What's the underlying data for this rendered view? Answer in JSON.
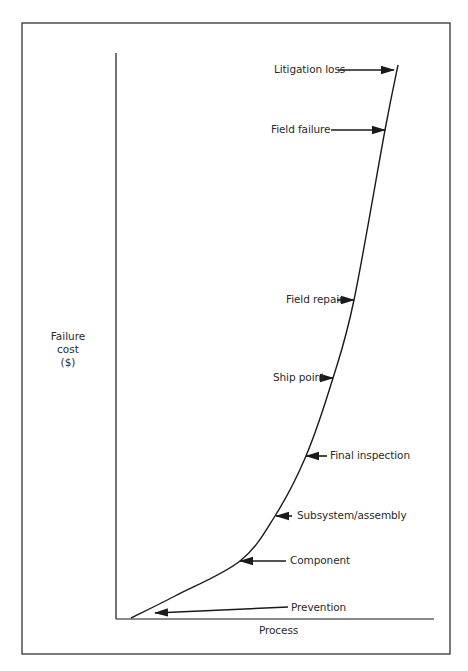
{
  "chart_data": {
    "type": "line",
    "title": "",
    "xlabel": "Process",
    "ylabel": "Failure cost ($)",
    "ylabel_lines": [
      "Failure",
      "cost",
      "($)"
    ],
    "grid": false,
    "legend": null,
    "stages": [
      {
        "label": "Prevention",
        "order": 1
      },
      {
        "label": "Component",
        "order": 2
      },
      {
        "label": "Subsystem/assembly",
        "order": 3
      },
      {
        "label": "Final inspection",
        "order": 4
      },
      {
        "label": "Ship point",
        "order": 5
      },
      {
        "label": "Field repair",
        "order": 6
      },
      {
        "label": "Field failure",
        "order": 7
      },
      {
        "label": "Litigation loss",
        "order": 8
      }
    ],
    "x": [
      1,
      2,
      3,
      4,
      5,
      6,
      7,
      8
    ],
    "relative_cost_estimate": [
      1,
      10,
      18,
      29,
      43,
      57,
      87,
      97
    ],
    "xlim": [
      0,
      10
    ],
    "ylim": [
      0,
      100
    ]
  },
  "colors": {
    "ink": "#1a1a1a",
    "text": "#2a2a2a",
    "frame": "#333333",
    "background": "#ffffff"
  },
  "layout": {
    "frame": {
      "x": 22,
      "y": 23,
      "w": 428,
      "h": 631
    },
    "axes": {
      "x0": 116,
      "y0": 619,
      "y_top": 53,
      "x_right": 434
    },
    "curve": [
      [
        131,
        618
      ],
      [
        175,
        596
      ],
      [
        240,
        561
      ],
      [
        275,
        516
      ],
      [
        306,
        456
      ],
      [
        333,
        378
      ],
      [
        354,
        300
      ],
      [
        385,
        130
      ],
      [
        398,
        65
      ]
    ],
    "annotations": [
      {
        "key": "litigation",
        "label": "Litigation loss",
        "tx": 274,
        "ty": 63,
        "from": [
          338,
          70
        ],
        "to": [
          394,
          70
        ]
      },
      {
        "key": "field_failure",
        "label": "Field failure",
        "tx": 271,
        "ty": 123,
        "from": [
          331,
          130
        ],
        "to": [
          385,
          130
        ]
      },
      {
        "key": "field_repair",
        "label": "Field repair",
        "tx": 286,
        "ty": 293,
        "from": [
          337,
          300
        ],
        "to": [
          354,
          300
        ]
      },
      {
        "key": "ship_point",
        "label": "Ship point",
        "tx": 273,
        "ty": 371,
        "from": [
          320,
          378
        ],
        "to": [
          333,
          378
        ]
      },
      {
        "key": "final_inspection",
        "label": "Final inspection",
        "tx": 330,
        "ty": 449,
        "from": [
          327,
          456
        ],
        "to": [
          306,
          456
        ]
      },
      {
        "key": "subsystem",
        "label": "Subsystem/assembly",
        "tx": 297,
        "ty": 509,
        "from": [
          292,
          516
        ],
        "to": [
          276,
          516
        ]
      },
      {
        "key": "component",
        "label": "Component",
        "tx": 290,
        "ty": 554,
        "from": [
          286,
          561
        ],
        "to": [
          240,
          561
        ]
      },
      {
        "key": "prevention",
        "label": "Prevention",
        "tx": 291,
        "ty": 601,
        "from": [
          288,
          607
        ],
        "to": [
          155,
          613
        ]
      }
    ],
    "xlabel_pos": {
      "x": 259,
      "y": 624
    }
  }
}
